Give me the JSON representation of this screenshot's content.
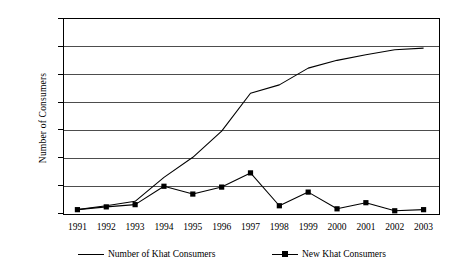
{
  "chart_data": {
    "type": "line",
    "title": "",
    "xlabel": "",
    "ylabel": "Number of Consumers",
    "categories": [
      "1991",
      "1992",
      "1993",
      "1994",
      "1995",
      "1996",
      "1997",
      "1998",
      "1999",
      "2000",
      "2001",
      "2002",
      "2003"
    ],
    "x": [
      1991,
      1992,
      1993,
      1994,
      1995,
      1996,
      1997,
      1998,
      1999,
      2000,
      2001,
      2002,
      2003
    ],
    "ylim": [
      0,
      3500
    ],
    "yticks": [
      0,
      500,
      1000,
      1500,
      2000,
      2500,
      3000,
      3500
    ],
    "ytick_labels": [
      "0",
      "500",
      "1000",
      "1500",
      "2000",
      "2500",
      "3000",
      "3500"
    ],
    "grid": true,
    "legend_position": "bottom",
    "series": [
      {
        "name": "Number of Khat Consumers",
        "marker": "none",
        "color": "#000000",
        "values": [
          60,
          130,
          210,
          640,
          1000,
          1470,
          2150,
          2300,
          2600,
          2740,
          2840,
          2930,
          2960
        ]
      },
      {
        "name": "New Khat Consumers",
        "marker": "square",
        "color": "#000000",
        "values": [
          60,
          110,
          150,
          480,
          340,
          465,
          720,
          130,
          375,
          75,
          185,
          40,
          60
        ]
      }
    ]
  },
  "axes": {
    "y_title": "Number of Consumers"
  },
  "legend": {
    "items": [
      {
        "label": "Number of Khat Consumers",
        "marker": "line"
      },
      {
        "label": "New Khat Consumers",
        "marker": "line-square"
      }
    ]
  }
}
